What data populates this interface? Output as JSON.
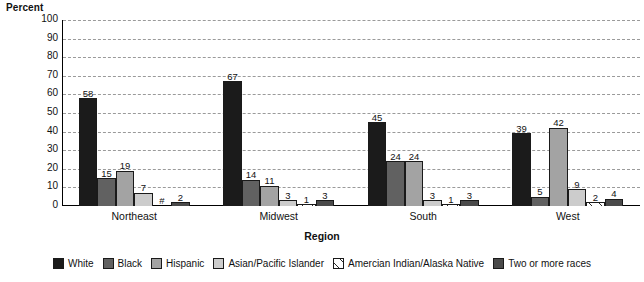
{
  "chart_data": {
    "type": "bar",
    "title": "",
    "xlabel": "Region",
    "ylabel": "Percent",
    "ylim": [
      0,
      100
    ],
    "ytick_step": 10,
    "yticks": [
      100,
      90,
      80,
      70,
      60,
      50,
      40,
      30,
      20,
      10,
      0
    ],
    "grid": true,
    "legend_position": "bottom",
    "categories": [
      "Northeast",
      "Midwest",
      "South",
      "West"
    ],
    "series": [
      {
        "name": "White",
        "color": "#1b1b1b",
        "pattern": "solid",
        "values": [
          58,
          67,
          45,
          39
        ],
        "labels": [
          "58",
          "67",
          "45",
          "39"
        ]
      },
      {
        "name": "Black",
        "color": "#616161",
        "pattern": "solid",
        "values": [
          15,
          14,
          24,
          5
        ],
        "labels": [
          "15",
          "14",
          "24",
          "5"
        ]
      },
      {
        "name": "Hispanic",
        "color": "#a3a3a3",
        "pattern": "solid",
        "values": [
          19,
          11,
          24,
          42
        ],
        "labels": [
          "19",
          "11",
          "24",
          "42"
        ]
      },
      {
        "name": "Asian/Pacific Islander",
        "color": "#cccccc",
        "pattern": "solid",
        "values": [
          7,
          3,
          3,
          9
        ],
        "labels": [
          "7",
          "3",
          "3",
          "9"
        ]
      },
      {
        "name": "Amercian Indian/Alaska Native",
        "color": "#ffffff",
        "pattern": "hatch",
        "values": [
          0,
          1,
          1,
          2
        ],
        "labels": [
          "#",
          "1",
          "1",
          "2"
        ]
      },
      {
        "name": "Two or more races",
        "color": "#4a4a4a",
        "pattern": "solid",
        "values": [
          2,
          3,
          3,
          4
        ],
        "labels": [
          "2",
          "3",
          "3",
          "4"
        ]
      }
    ]
  },
  "legend": {
    "items": [
      {
        "label": "White"
      },
      {
        "label": "Black"
      },
      {
        "label": "Hispanic"
      },
      {
        "label": "Asian/Pacific Islander"
      },
      {
        "label": "Amercian Indian/Alaska Native"
      },
      {
        "label": "Two or more races"
      }
    ]
  }
}
